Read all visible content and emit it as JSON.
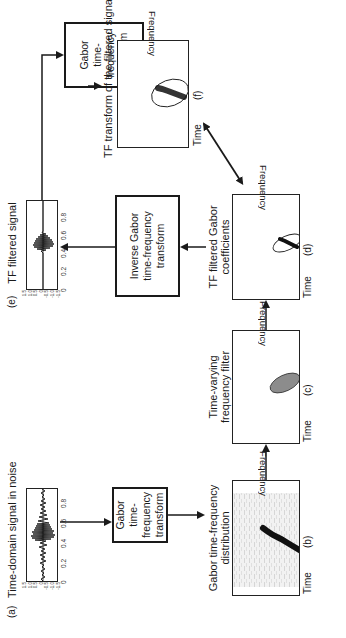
{
  "panels": {
    "a": {
      "id": "(a)",
      "title": "Time-domain signal in noise",
      "y_ticks": [
        "1.5",
        "1.0",
        "0.5",
        "0",
        "-0.5",
        "-1.0",
        "-1.5"
      ],
      "x_ticks": [
        "0",
        "0.2",
        "0.4",
        "0.6",
        "0.8"
      ]
    },
    "b": {
      "id": "(b)",
      "title_line1": "Gabor time-frequency",
      "title_line2": "distribution",
      "xlabel": "Time",
      "ylabel": "Frequency"
    },
    "c": {
      "id": "(c)",
      "title_line1": "Time-varying",
      "title_line2": "frequency filter",
      "xlabel": "Time",
      "ylabel": "Frequency"
    },
    "d": {
      "id": "(d)",
      "title_line1": "TF filtered Gabor",
      "title_line2": "coefficients",
      "xlabel": "Time",
      "ylabel": "Frequency"
    },
    "e": {
      "id": "(e)",
      "title": "TF filtered signal",
      "y_ticks": [
        "1.5",
        "1.0",
        "0.5",
        "0",
        "-0.5",
        "-1.0",
        "-1.5"
      ],
      "x_ticks": [
        "0",
        "0.2",
        "0.4",
        "0.6",
        "0.8"
      ]
    },
    "f": {
      "id": "(f)",
      "title": "TF transform of the filtered signal",
      "xlabel": "Time",
      "ylabel": "Frequency"
    }
  },
  "boxes": {
    "gabor_1": {
      "line1": "Gabor",
      "line2": "time-frequency",
      "line3": "transform"
    },
    "inverse": {
      "line1": "Inverse Gabor",
      "line2": "time-frequency",
      "line3": "transform"
    },
    "gabor_2": {
      "line1": "Gabor",
      "line2": "time-frequency",
      "line3": "transform"
    }
  },
  "colors": {
    "ink": "#1a1a1a",
    "filter_fill": "#8c8c8c",
    "background": "#ffffff"
  }
}
